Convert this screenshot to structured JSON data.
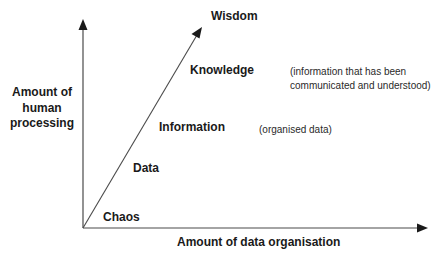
{
  "diagram": {
    "type": "dikw-progression",
    "axes": {
      "y_label": "Amount of human processing",
      "x_label": "Amount of data organisation"
    },
    "stages": [
      {
        "label": "Chaos",
        "note": ""
      },
      {
        "label": "Data",
        "note": ""
      },
      {
        "label": "Information",
        "note": "(organised data)"
      },
      {
        "label": "Knowledge",
        "note": "(information that has been communicated and understood)"
      },
      {
        "label": "Wisdom",
        "note": ""
      }
    ],
    "notes": {
      "information": "(organised data)",
      "knowledge_line1": "(information that has been",
      "knowledge_line2": "communicated and understood)"
    },
    "colors": {
      "line": "#4a4a4a",
      "text": "#1a1a1a",
      "background": "#ffffff"
    }
  }
}
